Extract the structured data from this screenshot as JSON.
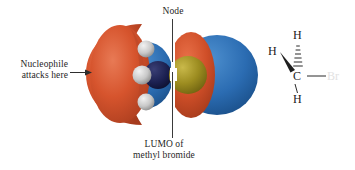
{
  "figure": {
    "background_color": "#ffffff",
    "width": 355,
    "height": 170
  },
  "annotations": {
    "nucleophile": {
      "text": "Nucleophile\nattacks here",
      "arrow_direction": "right",
      "points_to": "orange-lobe-left"
    },
    "node": {
      "text": "Node",
      "leader": "vertical-line-down",
      "points_to": "node-gap-center"
    },
    "lumo": {
      "text": "LUMO of\nmethyl bromide",
      "leader": "vertical-line-up",
      "points_to": "node-gap-center"
    }
  },
  "orbital": {
    "name": "LUMO of methyl bromide",
    "description": "sigma-star antibonding orbital of CH3Br",
    "lobes": [
      {
        "name": "outer-orange-lobe-left",
        "color": "#d4522c",
        "phase": "positive",
        "side": "carbon-backside"
      },
      {
        "name": "inner-blue-lobe-left",
        "color": "#2a6bb0",
        "phase": "negative",
        "side": "carbon"
      },
      {
        "name": "inner-orange-lobe-right",
        "color": "#d4522c",
        "phase": "positive",
        "side": "bromine"
      },
      {
        "name": "outer-blue-lobe-right",
        "color": "#2a6bb0",
        "phase": "negative",
        "side": "bromine-backside"
      }
    ],
    "node_color": "#ffffff",
    "atoms": [
      {
        "name": "hydrogen",
        "color": "#d0d0d0",
        "count": 3
      },
      {
        "name": "carbon",
        "color": "#1b1f4a",
        "count": 1
      },
      {
        "name": "bromine",
        "color": "#9b8a1e",
        "count": 1
      }
    ]
  },
  "lewis_structure": {
    "molecule": "methyl bromide",
    "atoms": {
      "h_top": "H",
      "h_left": "H",
      "carbon": "C",
      "h_bottom": "H",
      "bromine": "Br"
    },
    "bonds": [
      {
        "from": "C",
        "to": "H",
        "style": "hashed",
        "position": "top"
      },
      {
        "from": "C",
        "to": "H",
        "style": "wedge",
        "position": "left"
      },
      {
        "from": "C",
        "to": "H",
        "style": "plain",
        "position": "bottom"
      },
      {
        "from": "C",
        "to": "Br",
        "style": "plain",
        "position": "right"
      }
    ],
    "bromine_color": "#e2e2e2"
  },
  "colors": {
    "orange_phase": "#d4522c",
    "blue_phase": "#2a6bb0",
    "text": "#1f1f1f",
    "leader_line": "#3a3a3a"
  }
}
